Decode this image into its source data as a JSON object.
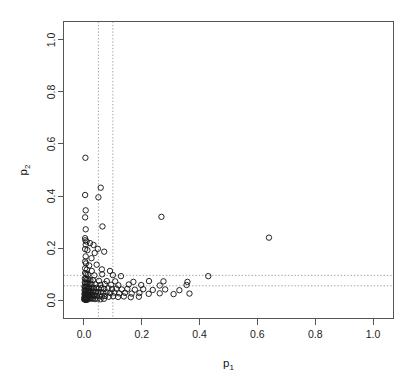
{
  "chart_data": {
    "type": "scatter",
    "title": "",
    "xlabel": "p1",
    "xlabel_base": "p",
    "xlabel_sub": "1",
    "ylabel": "p2",
    "ylabel_base": "p",
    "ylabel_sub": "2",
    "xlim": [
      0.0,
      1.0
    ],
    "ylim": [
      0.0,
      1.04
    ],
    "grid": false,
    "legend": null,
    "xticks": [
      0.0,
      0.2,
      0.4,
      0.6,
      0.8,
      1.0
    ],
    "xticklabels": [
      "0.0",
      "0.2",
      "0.4",
      "0.6",
      "0.8",
      "1.0"
    ],
    "yticks": [
      0.0,
      0.2,
      0.4,
      0.6,
      0.8,
      1.0
    ],
    "yticklabels": [
      "0.0",
      "0.2",
      "0.4",
      "0.6",
      "0.8",
      "1.0"
    ],
    "marker": "open-circle",
    "marker_color": "#1a1a1a",
    "reference_lines": {
      "vertical": [
        0.05,
        0.1
      ],
      "horizontal": [
        0.095,
        0.055
      ],
      "style": "dotted",
      "color": "#9a9a9a"
    },
    "points": [
      [
        0.005,
        0.547
      ],
      [
        0.004,
        0.404
      ],
      [
        0.05,
        0.395
      ],
      [
        0.058,
        0.432
      ],
      [
        0.006,
        0.345
      ],
      [
        0.004,
        0.318
      ],
      [
        0.268,
        0.32
      ],
      [
        0.064,
        0.283
      ],
      [
        0.006,
        0.272
      ],
      [
        0.004,
        0.238
      ],
      [
        0.005,
        0.23
      ],
      [
        0.009,
        0.225
      ],
      [
        0.006,
        0.213
      ],
      [
        0.021,
        0.219
      ],
      [
        0.033,
        0.212
      ],
      [
        0.64,
        0.24
      ],
      [
        0.004,
        0.196
      ],
      [
        0.012,
        0.192
      ],
      [
        0.048,
        0.197
      ],
      [
        0.037,
        0.181
      ],
      [
        0.07,
        0.186
      ],
      [
        0.006,
        0.168
      ],
      [
        0.026,
        0.161
      ],
      [
        0.004,
        0.148
      ],
      [
        0.007,
        0.141
      ],
      [
        0.018,
        0.133
      ],
      [
        0.044,
        0.136
      ],
      [
        0.004,
        0.122
      ],
      [
        0.01,
        0.117
      ],
      [
        0.027,
        0.112
      ],
      [
        0.062,
        0.118
      ],
      [
        0.09,
        0.112
      ],
      [
        0.004,
        0.104
      ],
      [
        0.008,
        0.1
      ],
      [
        0.014,
        0.098
      ],
      [
        0.036,
        0.095
      ],
      [
        0.063,
        0.099
      ],
      [
        0.1,
        0.096
      ],
      [
        0.128,
        0.092
      ],
      [
        0.43,
        0.092
      ],
      [
        0.003,
        0.083
      ],
      [
        0.006,
        0.081
      ],
      [
        0.01,
        0.078
      ],
      [
        0.016,
        0.08
      ],
      [
        0.022,
        0.076
      ],
      [
        0.031,
        0.077
      ],
      [
        0.052,
        0.074
      ],
      [
        0.079,
        0.073
      ],
      [
        0.108,
        0.072
      ],
      [
        0.171,
        0.07
      ],
      [
        0.225,
        0.073
      ],
      [
        0.275,
        0.072
      ],
      [
        0.358,
        0.07
      ],
      [
        0.003,
        0.068
      ],
      [
        0.005,
        0.064
      ],
      [
        0.009,
        0.063
      ],
      [
        0.013,
        0.066
      ],
      [
        0.019,
        0.061
      ],
      [
        0.026,
        0.062
      ],
      [
        0.04,
        0.06
      ],
      [
        0.057,
        0.058
      ],
      [
        0.072,
        0.062
      ],
      [
        0.094,
        0.059
      ],
      [
        0.119,
        0.057
      ],
      [
        0.155,
        0.06
      ],
      [
        0.198,
        0.058
      ],
      [
        0.262,
        0.056
      ],
      [
        0.355,
        0.058
      ],
      [
        0.002,
        0.052
      ],
      [
        0.004,
        0.05
      ],
      [
        0.007,
        0.048
      ],
      [
        0.01,
        0.052
      ],
      [
        0.014,
        0.047
      ],
      [
        0.018,
        0.049
      ],
      [
        0.023,
        0.046
      ],
      [
        0.029,
        0.048
      ],
      [
        0.035,
        0.045
      ],
      [
        0.043,
        0.047
      ],
      [
        0.051,
        0.044
      ],
      [
        0.06,
        0.046
      ],
      [
        0.07,
        0.043
      ],
      [
        0.083,
        0.045
      ],
      [
        0.097,
        0.042
      ],
      [
        0.112,
        0.044
      ],
      [
        0.131,
        0.041
      ],
      [
        0.15,
        0.043
      ],
      [
        0.176,
        0.04
      ],
      [
        0.205,
        0.042
      ],
      [
        0.238,
        0.039
      ],
      [
        0.281,
        0.041
      ],
      [
        0.33,
        0.038
      ],
      [
        0.002,
        0.038
      ],
      [
        0.004,
        0.036
      ],
      [
        0.006,
        0.034
      ],
      [
        0.008,
        0.037
      ],
      [
        0.011,
        0.033
      ],
      [
        0.014,
        0.035
      ],
      [
        0.017,
        0.032
      ],
      [
        0.021,
        0.034
      ],
      [
        0.025,
        0.031
      ],
      [
        0.03,
        0.033
      ],
      [
        0.036,
        0.03
      ],
      [
        0.042,
        0.032
      ],
      [
        0.049,
        0.029
      ],
      [
        0.058,
        0.031
      ],
      [
        0.067,
        0.028
      ],
      [
        0.078,
        0.03
      ],
      [
        0.091,
        0.027
      ],
      [
        0.105,
        0.029
      ],
      [
        0.122,
        0.026
      ],
      [
        0.142,
        0.028
      ],
      [
        0.165,
        0.025
      ],
      [
        0.192,
        0.027
      ],
      [
        0.224,
        0.024
      ],
      [
        0.262,
        0.026
      ],
      [
        0.31,
        0.023
      ],
      [
        0.365,
        0.025
      ],
      [
        0.002,
        0.024
      ],
      [
        0.003,
        0.022
      ],
      [
        0.005,
        0.02
      ],
      [
        0.007,
        0.023
      ],
      [
        0.009,
        0.019
      ],
      [
        0.012,
        0.021
      ],
      [
        0.015,
        0.018
      ],
      [
        0.018,
        0.02
      ],
      [
        0.022,
        0.017
      ],
      [
        0.027,
        0.019
      ],
      [
        0.032,
        0.016
      ],
      [
        0.038,
        0.018
      ],
      [
        0.045,
        0.015
      ],
      [
        0.053,
        0.017
      ],
      [
        0.062,
        0.014
      ],
      [
        0.073,
        0.016
      ],
      [
        0.086,
        0.013
      ],
      [
        0.101,
        0.015
      ],
      [
        0.118,
        0.012
      ],
      [
        0.138,
        0.014
      ],
      [
        0.162,
        0.011
      ],
      [
        0.19,
        0.013
      ],
      [
        0.002,
        0.012
      ],
      [
        0.003,
        0.01
      ],
      [
        0.005,
        0.008
      ],
      [
        0.007,
        0.011
      ],
      [
        0.009,
        0.007
      ],
      [
        0.012,
        0.009
      ],
      [
        0.016,
        0.006
      ],
      [
        0.02,
        0.008
      ],
      [
        0.025,
        0.005
      ],
      [
        0.031,
        0.007
      ],
      [
        0.038,
        0.004
      ],
      [
        0.047,
        0.006
      ],
      [
        0.057,
        0.003
      ],
      [
        0.069,
        0.005
      ],
      [
        0.001,
        0.004
      ],
      [
        0.002,
        0.002
      ],
      [
        0.004,
        0.003
      ],
      [
        0.006,
        0.001
      ],
      [
        0.008,
        0.002
      ],
      [
        0.011,
        0.001
      ]
    ]
  }
}
